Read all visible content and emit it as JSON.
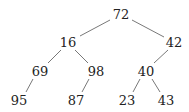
{
  "tree": {
    "nodes": [
      {
        "id": "n72",
        "label": "72",
        "x": 121,
        "y": 14
      },
      {
        "id": "n16",
        "label": "16",
        "x": 68,
        "y": 42
      },
      {
        "id": "n42",
        "label": "42",
        "x": 174,
        "y": 42
      },
      {
        "id": "n69",
        "label": "69",
        "x": 40,
        "y": 71
      },
      {
        "id": "n98",
        "label": "98",
        "x": 96,
        "y": 71
      },
      {
        "id": "n40",
        "label": "40",
        "x": 146,
        "y": 71
      },
      {
        "id": "n95",
        "label": "95",
        "x": 19,
        "y": 100
      },
      {
        "id": "n87",
        "label": "87",
        "x": 76,
        "y": 100
      },
      {
        "id": "n23",
        "label": "23",
        "x": 127,
        "y": 100
      },
      {
        "id": "n43",
        "label": "43",
        "x": 166,
        "y": 100
      }
    ],
    "edges": [
      {
        "from": "n72",
        "to": "n16",
        "x1": 110,
        "y1": 20,
        "x2": 80,
        "y2": 36
      },
      {
        "from": "n72",
        "to": "n42",
        "x1": 132,
        "y1": 20,
        "x2": 164,
        "y2": 37
      },
      {
        "from": "n16",
        "to": "n69",
        "x1": 61,
        "y1": 50,
        "x2": 48,
        "y2": 63
      },
      {
        "from": "n16",
        "to": "n98",
        "x1": 75,
        "y1": 50,
        "x2": 88,
        "y2": 63
      },
      {
        "from": "n42",
        "to": "n40",
        "x1": 168,
        "y1": 50,
        "x2": 154,
        "y2": 63
      },
      {
        "from": "n69",
        "to": "n95",
        "x1": 33,
        "y1": 79,
        "x2": 26,
        "y2": 92
      },
      {
        "from": "n98",
        "to": "n87",
        "x1": 89,
        "y1": 79,
        "x2": 82,
        "y2": 92
      },
      {
        "from": "n40",
        "to": "n23",
        "x1": 140,
        "y1": 79,
        "x2": 133,
        "y2": 92
      },
      {
        "from": "n40",
        "to": "n43",
        "x1": 152,
        "y1": 79,
        "x2": 160,
        "y2": 92
      }
    ]
  }
}
